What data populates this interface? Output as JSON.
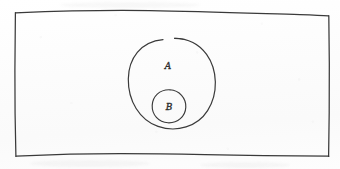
{
  "diagram": {
    "type": "euler-set-diagram",
    "medium": "hand-drawn pencil sketch on paper",
    "title": "",
    "universe": {
      "shape": "rectangle",
      "name": "universal-set-rectangle",
      "label": "",
      "stroke_color": "#3a3a3a",
      "bounds": {
        "x": 14,
        "y": 11,
        "width": 314,
        "height": 146
      }
    },
    "sets": [
      {
        "id": "A",
        "label": "A",
        "shape": "circle",
        "center": {
          "x": 172,
          "y": 83
        },
        "radius": 44,
        "label_position": {
          "x": 168,
          "y": 66
        },
        "stroke_color": "#3a3a3a",
        "open_gap": true,
        "contained_in": "universe"
      },
      {
        "id": "B",
        "label": "B",
        "shape": "circle",
        "center": {
          "x": 169,
          "y": 106
        },
        "radius": 17,
        "label_position": {
          "x": 169,
          "y": 107
        },
        "stroke_color": "#3a3a3a",
        "open_gap": false,
        "contained_in": "A"
      }
    ],
    "relation": "B is a proper subset of A; A is a subset of the universal set"
  },
  "colors": {
    "ink": "#3a3a3a",
    "label_ink": "#2e2e2e",
    "paper": "#fdfdfd"
  }
}
